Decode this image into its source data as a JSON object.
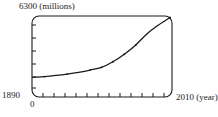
{
  "chart_data": {
    "type": "line",
    "title": "",
    "subtitle": "",
    "xlabel": "2010 (year)",
    "ylabel": "6300 (millions)",
    "y_axis_top_label": "6300 (millions)",
    "x_axis_start_label": "1890",
    "x_axis_origin_label": "0",
    "x_axis_end_label": "2010 (year)",
    "xlim": [
      1890,
      2010
    ],
    "ylim": [
      0,
      6300
    ],
    "grid": false,
    "legend": null,
    "x_tick_count": 12,
    "y_tick_count": 6,
    "series": [
      {
        "name": "World population",
        "x": [
          1890,
          1900,
          1910,
          1920,
          1930,
          1940,
          1950,
          1960,
          1970,
          1980,
          1990,
          2000,
          2010
        ],
        "values": [
          1500,
          1560,
          1650,
          1760,
          1900,
          2080,
          2300,
          2750,
          3350,
          4100,
          5000,
          5700,
          6300
        ]
      }
    ],
    "marker_points": [
      {
        "x": 1900,
        "y": 1560
      },
      {
        "x": 1920,
        "y": 1760
      },
      {
        "x": 1940,
        "y": 2080
      },
      {
        "x": 1950,
        "y": 2300
      },
      {
        "x": 1960,
        "y": 2750
      },
      {
        "x": 1970,
        "y": 3350
      },
      {
        "x": 1980,
        "y": 4100
      },
      {
        "x": 2010,
        "y": 6300
      }
    ],
    "curve_color": "#1a1a1a",
    "frame_color": "#1a1a1a",
    "background_color": "#ffffff"
  }
}
